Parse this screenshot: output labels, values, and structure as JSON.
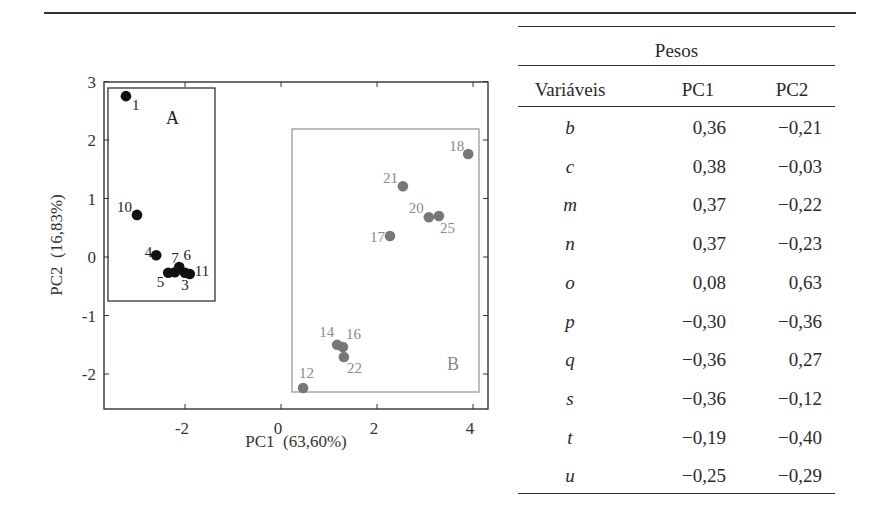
{
  "chart_data": [
    {
      "type": "scatter",
      "title": "",
      "xlabel": "PC1  (63,60%)",
      "ylabel": "PC2  (16,83%)",
      "xlim": [
        -3.7,
        4.3
      ],
      "ylim": [
        -2.6,
        3.0
      ],
      "xticks": [
        -2,
        0,
        2,
        4
      ],
      "yticks": [
        3,
        2,
        1,
        0,
        -1,
        -2
      ],
      "grid": false,
      "legend": null,
      "groups": [
        {
          "name": "A",
          "color": "#111111",
          "box": {
            "x0": -3.5,
            "x1": -1.38,
            "y0": -0.76,
            "y1": 2.89
          },
          "points": [
            {
              "label": "1",
              "x": -3.23,
              "y": 2.75
            },
            {
              "label": "10",
              "x": -3.0,
              "y": 0.72
            },
            {
              "label": "4",
              "x": -2.6,
              "y": 0.03
            },
            {
              "label": "5",
              "x": -2.35,
              "y": -0.27
            },
            {
              "label": "7",
              "x": -2.21,
              "y": -0.26
            },
            {
              "label": "6",
              "x": -2.12,
              "y": -0.17
            },
            {
              "label": "3",
              "x": -2.0,
              "y": -0.27
            },
            {
              "label": "11",
              "x": -1.9,
              "y": -0.29
            }
          ]
        },
        {
          "name": "B",
          "color": "#777777",
          "box": {
            "x0": 0.23,
            "x1": 4.13,
            "y0": -2.3,
            "y1": 2.2
          },
          "points": [
            {
              "label": "18",
              "x": 3.9,
              "y": 1.76
            },
            {
              "label": "21",
              "x": 2.54,
              "y": 1.21
            },
            {
              "label": "20",
              "x": 3.08,
              "y": 0.68
            },
            {
              "label": "25",
              "x": 3.29,
              "y": 0.7
            },
            {
              "label": "17",
              "x": 2.27,
              "y": 0.36
            },
            {
              "label": "14",
              "x": 1.17,
              "y": -1.5
            },
            {
              "label": "16",
              "x": 1.29,
              "y": -1.54
            },
            {
              "label": "22",
              "x": 1.31,
              "y": -1.71
            },
            {
              "label": "12",
              "x": 0.46,
              "y": -2.24
            }
          ]
        }
      ]
    },
    {
      "type": "table",
      "group_header": "Pesos",
      "columns": [
        "Variáveis",
        "PC1",
        "PC2"
      ],
      "rows": [
        {
          "var": "b",
          "pc1": "0,36",
          "pc2": "−0,21"
        },
        {
          "var": "c",
          "pc1": "0,38",
          "pc2": "−0,03"
        },
        {
          "var": "m",
          "pc1": "0,37",
          "pc2": "−0,22"
        },
        {
          "var": "n",
          "pc1": "0,37",
          "pc2": "−0,23"
        },
        {
          "var": "o",
          "pc1": "0,08",
          "pc2": "0,63"
        },
        {
          "var": "p",
          "pc1": "−0,30",
          "pc2": "−0,36"
        },
        {
          "var": "q",
          "pc1": "−0,36",
          "pc2": "0,27"
        },
        {
          "var": "s",
          "pc1": "−0,36",
          "pc2": "−0,12"
        },
        {
          "var": "t",
          "pc1": "−0,19",
          "pc2": "−0,40"
        },
        {
          "var": "u",
          "pc1": "−0,25",
          "pc2": "−0,29"
        }
      ]
    }
  ],
  "plot": {
    "xlabel": "PC1  (63,60%)",
    "ylabel": "PC2  (16,83%)",
    "xtick_labels": [
      "-2",
      "0",
      "2",
      "4"
    ],
    "ytick_labels": [
      "3",
      "2",
      "1",
      "0",
      "-1",
      "-2"
    ],
    "group_a_label": "A",
    "group_b_label": "B"
  },
  "table": {
    "group_header": "Pesos",
    "col_var": "Variáveis",
    "col_pc1": "PC1",
    "col_pc2": "PC2"
  }
}
